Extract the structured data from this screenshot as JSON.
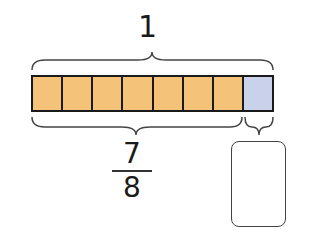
{
  "diagram": {
    "whole_label": "1",
    "total_parts": 8,
    "shaded_parts": 7,
    "fraction": {
      "numerator": "7",
      "denominator": "8"
    },
    "answer_box": "",
    "colors": {
      "shaded": "#F5C27A",
      "unshaded": "#C9D2EA",
      "outline": "#1a1a1a"
    }
  }
}
